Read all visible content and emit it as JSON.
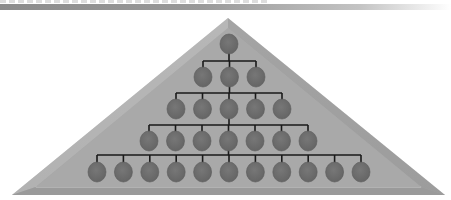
{
  "diagram": {
    "type": "hierarchy-pyramid",
    "colors": {
      "pyramid_fill": "#a9a9a9",
      "pyramid_light": "#bdbdbd",
      "pyramid_dark": "#8f8f8f",
      "node_fill": "#6f6f6f",
      "node_stroke": "#5a5a5a",
      "connector": "#1a1a1a",
      "header_bar": "#8c8c8c"
    },
    "pyramid": {
      "apex": [
        228,
        18
      ],
      "base_left": [
        12,
        195
      ],
      "base_right": [
        445,
        195
      ],
      "bevel_y": 187
    },
    "levels": [
      {
        "count": 1,
        "y": 44,
        "x_start": 229,
        "spacing": 0,
        "bar_y": null
      },
      {
        "count": 3,
        "y": 77,
        "x_start": 203,
        "spacing": 26.5,
        "bar_y": 61
      },
      {
        "count": 5,
        "y": 109,
        "x_start": 176,
        "spacing": 26.5,
        "bar_y": 93
      },
      {
        "count": 7,
        "y": 141,
        "x_start": 149,
        "spacing": 26.5,
        "bar_y": 125
      },
      {
        "count": 11,
        "y": 172,
        "x_start": 97,
        "spacing": 26.4,
        "bar_y": 155
      }
    ],
    "node_radius": {
      "rx": 9,
      "ry": 10
    }
  }
}
